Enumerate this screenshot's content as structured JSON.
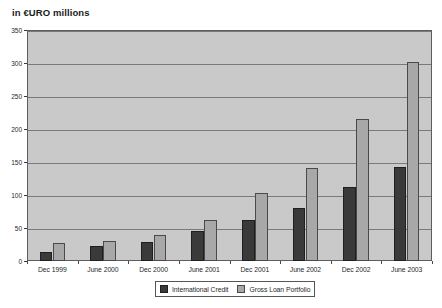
{
  "chart_data": {
    "type": "bar",
    "title": "in €URO millions",
    "xlabel": "",
    "ylabel": "",
    "ylim": [
      0,
      350
    ],
    "ytick_step": 50,
    "yticks": [
      0,
      50,
      100,
      150,
      200,
      250,
      300,
      350
    ],
    "grid": true,
    "legend_position": "bottom-center",
    "categories": [
      "Dec 1999",
      "June 2000",
      "Dec 2000",
      "June 2001",
      "Dec 2001",
      "June 2002",
      "Dec 2002",
      "June 2003"
    ],
    "series": [
      {
        "name": "International Credit",
        "color": "#3a3a3a",
        "values": [
          14,
          22,
          29,
          45,
          62,
          80,
          112,
          142
        ]
      },
      {
        "name": "Gross Loan Portfolio",
        "color": "#a8a8a8",
        "values": [
          28,
          30,
          39,
          62,
          103,
          141,
          215,
          301
        ]
      }
    ]
  },
  "colors": {
    "plot_background": "#c9c9c9",
    "gridline": "#7a7a7a",
    "frame_border": "#5d5d5d",
    "page_background": "#ffffff",
    "text": "#1f1f1f"
  }
}
